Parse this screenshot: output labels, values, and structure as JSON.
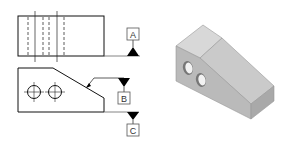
{
  "diagram": {
    "type": "engineering-drawing",
    "views": {
      "top_view": {
        "label": "top-view"
      },
      "front_view": {
        "label": "front-view",
        "holes": 2
      },
      "isometric_view": {
        "label": "isometric-view",
        "holes": 2
      }
    },
    "datums": [
      {
        "id": "A",
        "label": "A"
      },
      {
        "id": "B",
        "label": "B"
      },
      {
        "id": "C",
        "label": "C"
      }
    ],
    "colors": {
      "line": "#111111",
      "hidden_line": "#333333",
      "iso_top": "#d6d6d6",
      "iso_slope": "#c9c9c9",
      "iso_side": "#b9b9b9",
      "iso_front_end": "#a8a8a8",
      "iso_hole": "#f2f2f2"
    }
  }
}
